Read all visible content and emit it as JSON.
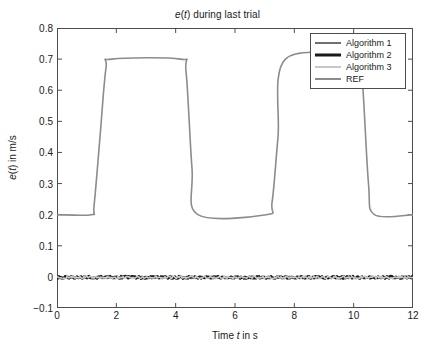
{
  "figure": {
    "title_html": "<span class='it'>e</span>(<span class='it'>t</span>) during last trial",
    "title_text": "e(t) during last trial",
    "background": "#ffffff",
    "axis_color": "#4d4d4d"
  },
  "axes": {
    "xlabel_text": "Time t in s",
    "ylabel_text": "e(t) in m/s",
    "x_ticks": [
      "0",
      "2",
      "4",
      "6",
      "8",
      "10",
      "12"
    ],
    "y_ticks": [
      "0.8",
      "0.7",
      "0.6",
      "0.5",
      "0.4",
      "0.3",
      "0.2",
      "0.1",
      "0",
      "-0.1"
    ]
  },
  "legend": {
    "position": "top-right",
    "entries": [
      {
        "label": "Algorithm 1",
        "color": "#707070",
        "width": 1.6
      },
      {
        "label": "Algorithm 2",
        "color": "#1a1a1a",
        "width": 2.6
      },
      {
        "label": "Algorithm 3",
        "color": "#c8c8c8",
        "width": 1.6
      },
      {
        "label": "REF",
        "color": "#8c8c8c",
        "width": 1.6
      }
    ]
  },
  "chart_data": {
    "type": "line",
    "title": "e(t) during last trial",
    "xlabel": "Time t in s",
    "ylabel": "e(t) in m/s",
    "xlim": [
      0,
      12
    ],
    "ylim": [
      -0.1,
      0.8
    ],
    "xticks": [
      0,
      2,
      4,
      6,
      8,
      10,
      12
    ],
    "yticks": [
      -0.1,
      0,
      0.1,
      0.2,
      0.3,
      0.4,
      0.5,
      0.6,
      0.7,
      0.8
    ],
    "grid": false,
    "legend_position": "upper right",
    "series": [
      {
        "name": "REF",
        "color": "#8c8c8c",
        "width": 1.6,
        "description": "Reference trapezoidal velocity profile: baseline 0.2 m/s with two smooth plateaus at 0.7 m/s",
        "x": [
          0,
          1.15,
          1.25,
          1.45,
          1.65,
          1.85,
          4.15,
          4.35,
          4.55,
          4.75,
          7.05,
          7.25,
          7.45,
          7.7,
          10.15,
          10.3,
          10.5,
          10.7,
          12
        ],
        "y": [
          0.2,
          0.2,
          0.23,
          0.45,
          0.67,
          0.7,
          0.7,
          0.66,
          0.35,
          0.2,
          0.2,
          0.24,
          0.45,
          0.7,
          0.7,
          0.62,
          0.3,
          0.2,
          0.2
        ]
      },
      {
        "name": "Algorithm 1",
        "color": "#707070",
        "width": 1.6,
        "description": "Tracking error trace, near zero with small noise",
        "x": [
          0,
          1,
          2,
          3,
          4,
          5,
          6,
          7,
          8,
          9,
          10,
          11,
          12
        ],
        "y": [
          0.002,
          0.001,
          0.003,
          0.0,
          0.002,
          -0.001,
          0.002,
          0.0,
          0.001,
          -0.002,
          0.001,
          0.0,
          -0.002
        ]
      },
      {
        "name": "Algorithm 2",
        "color": "#1a1a1a",
        "width": 2.6,
        "description": "Tracking error trace, near zero with small noise",
        "x": [
          0,
          1,
          2,
          3,
          4,
          5,
          6,
          7,
          8,
          9,
          10,
          11,
          12
        ],
        "y": [
          0.001,
          0.002,
          -0.001,
          0.002,
          0.0,
          0.001,
          -0.002,
          0.001,
          0.002,
          0.0,
          -0.001,
          0.002,
          -0.003
        ]
      },
      {
        "name": "Algorithm 3",
        "color": "#c8c8c8",
        "width": 1.6,
        "description": "Tracking error trace, near zero with small noise",
        "x": [
          0,
          1,
          2,
          3,
          4,
          5,
          6,
          7,
          8,
          9,
          10,
          11,
          12
        ],
        "y": [
          0.0,
          0.003,
          0.001,
          -0.001,
          0.003,
          0.0,
          0.001,
          0.002,
          -0.001,
          0.001,
          0.002,
          -0.001,
          -0.002
        ]
      }
    ]
  }
}
